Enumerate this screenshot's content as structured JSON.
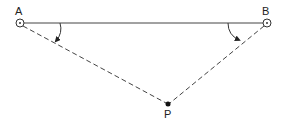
{
  "diagram": {
    "points": {
      "A": {
        "label": "A",
        "x": 20,
        "y": 23
      },
      "B": {
        "label": "B",
        "x": 267,
        "y": 23
      },
      "P": {
        "label": "P",
        "x": 168,
        "y": 104
      }
    },
    "segments": [
      {
        "from": "A",
        "to": "B",
        "style": "solid"
      },
      {
        "from": "A",
        "to": "P",
        "style": "dashed"
      },
      {
        "from": "B",
        "to": "P",
        "style": "dashed"
      }
    ],
    "angle_marks": [
      {
        "vertex": "A",
        "from": "AB",
        "to": "AP",
        "arrow": true
      },
      {
        "vertex": "B",
        "from": "BA",
        "to": "BP",
        "arrow": true
      }
    ],
    "colors": {
      "line": "#333333",
      "background": "#ffffff"
    }
  }
}
